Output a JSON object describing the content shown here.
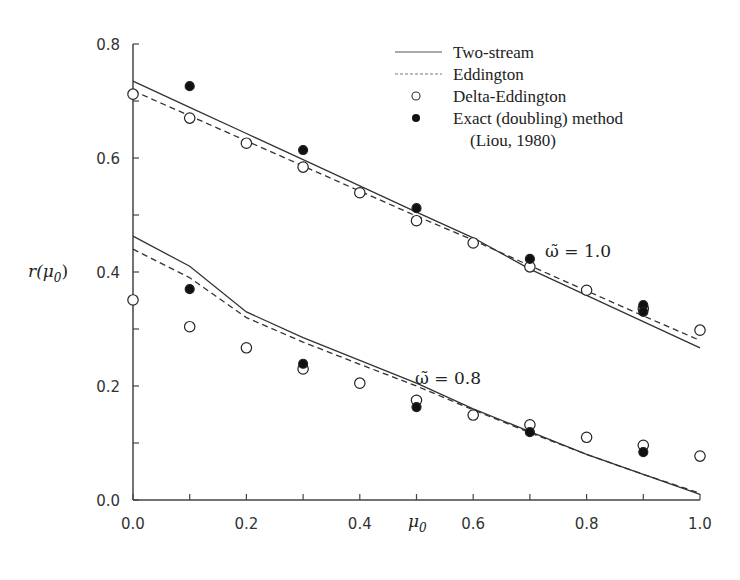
{
  "chart_data": {
    "type": "line",
    "title": "",
    "xlabel": "μ0",
    "ylabel": "r(μ0)",
    "xlim": [
      0.0,
      1.0
    ],
    "ylim": [
      0.0,
      0.8
    ],
    "xticks": [
      "0.0",
      "0.2",
      "0.4",
      "0.6",
      "0.8",
      "1.0"
    ],
    "yticks": [
      "0.0",
      "0.2",
      "0.4",
      "0.6",
      "0.8"
    ],
    "grid": false,
    "legend_position": "upper right",
    "legend": [
      {
        "label": "Two-stream",
        "style": "solid-line"
      },
      {
        "label": "Eddington",
        "style": "dashed-line"
      },
      {
        "label": "Delta-Eddington",
        "style": "open-circle"
      },
      {
        "label": "Exact (doubling) method",
        "style": "filled-circle"
      },
      {
        "label": "(Liou, 1980)",
        "style": "none"
      }
    ],
    "annotations": [
      {
        "text": "ω̃ = 1.0",
        "x": 0.7,
        "y": 0.43
      },
      {
        "text": "ω̃ = 0.8",
        "x": 0.5,
        "y": 0.21
      }
    ],
    "x": [
      0.0,
      0.1,
      0.2,
      0.3,
      0.4,
      0.5,
      0.6,
      0.7,
      0.8,
      0.9,
      1.0
    ],
    "series": [
      {
        "name": "Two-stream (ω̃=1.0)",
        "style": "solid",
        "values": [
          0.735,
          0.689,
          0.643,
          0.597,
          0.551,
          0.505,
          0.46,
          0.405,
          0.359,
          0.313,
          0.267
        ]
      },
      {
        "name": "Eddington (ω̃=1.0)",
        "style": "dashed",
        "values": [
          0.718,
          0.674,
          0.63,
          0.586,
          0.542,
          0.498,
          0.456,
          0.411,
          0.367,
          0.323,
          0.28
        ]
      },
      {
        "name": "Delta-Eddington (ω̃=1.0)",
        "style": "open-circle",
        "values": [
          0.712,
          0.67,
          0.626,
          0.584,
          0.539,
          0.49,
          0.451,
          0.409,
          0.368,
          0.336,
          0.298
        ]
      },
      {
        "name": "Exact doubling (ω̃=1.0)",
        "style": "filled-circle",
        "x": [
          0.1,
          0.3,
          0.5,
          0.7,
          0.9,
          0.9
        ],
        "values": [
          0.726,
          0.614,
          0.512,
          0.423,
          0.342,
          0.33
        ]
      },
      {
        "name": "Two-stream (ω̃=0.8)",
        "style": "solid",
        "values": [
          0.463,
          0.41,
          0.33,
          0.285,
          0.245,
          0.205,
          0.16,
          0.12,
          0.08,
          0.045,
          0.01
        ]
      },
      {
        "name": "Eddington (ω̃=0.8)",
        "style": "dashed",
        "values": [
          0.44,
          0.39,
          0.32,
          0.277,
          0.238,
          0.2,
          0.158,
          0.118,
          0.08,
          0.045,
          0.012
        ]
      },
      {
        "name": "Delta-Eddington (ω̃=0.8)",
        "style": "open-circle",
        "values": [
          0.351,
          0.304,
          0.267,
          0.23,
          0.205,
          0.175,
          0.149,
          0.132,
          0.11,
          0.096,
          0.077
        ]
      },
      {
        "name": "Exact doubling (ω̃=0.8)",
        "style": "filled-circle",
        "x": [
          0.1,
          0.3,
          0.5,
          0.7,
          0.9
        ],
        "values": [
          0.37,
          0.239,
          0.163,
          0.119,
          0.084
        ]
      }
    ]
  },
  "labels": {
    "xlabel": "μ",
    "xlabel_sub": "0",
    "ylabel_main": "r(μ",
    "ylabel_sub": "0",
    "ylabel_end": ")",
    "annot_top": "ω̃ = 1.0",
    "annot_bottom": "ω̃ = 0.8"
  }
}
